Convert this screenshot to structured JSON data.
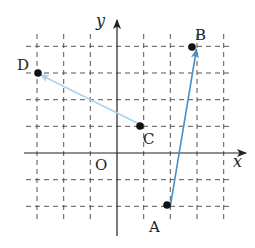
{
  "diagram": {
    "type": "coordinate-plane-vectors",
    "axes": {
      "x_label": "x",
      "y_label": "y",
      "origin_label": "O"
    },
    "grid": {
      "x_min": -3,
      "x_max": 4,
      "y_min": -2,
      "y_max": 4,
      "style": "dashed"
    },
    "points": [
      {
        "name": "A",
        "x": 2,
        "y": -2
      },
      {
        "name": "B",
        "x": 3,
        "y": 4
      },
      {
        "name": "C",
        "x": 1,
        "y": 1
      },
      {
        "name": "D",
        "x": -3,
        "y": 3
      }
    ],
    "vectors": [
      {
        "from": "A",
        "to": "B",
        "color": "#4a90c8"
      },
      {
        "from": "C",
        "to": "D",
        "color": "#a6d4f2"
      }
    ]
  }
}
